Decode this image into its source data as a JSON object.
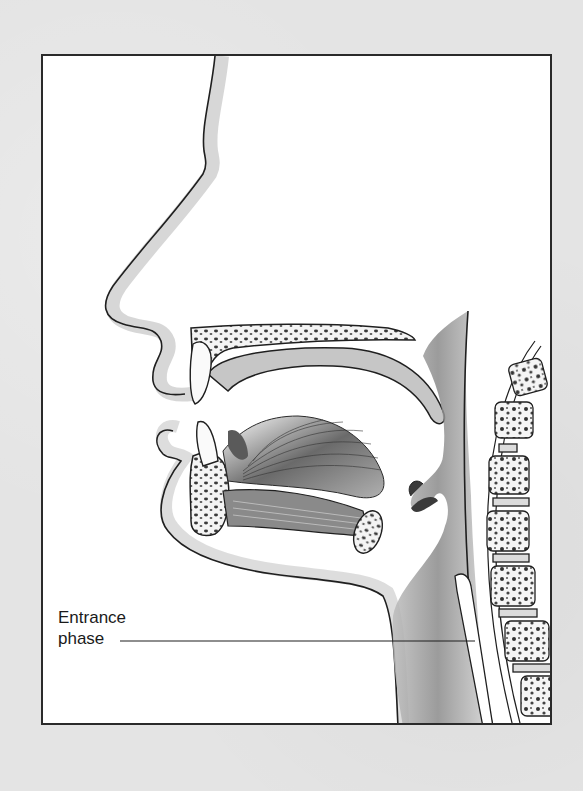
{
  "figure": {
    "colors": {
      "page_background": "#e4e4e4",
      "frame_fill": "#ffffff",
      "frame_border": "#2a2a2a",
      "outline": "#1f1f1f",
      "soft_tissue_shade": "#9a9a9a",
      "bone_fill": "#f4f4f4"
    }
  },
  "annotations": [
    {
      "line1": "Entrance",
      "line2": "phase",
      "pointer_target": "throat (pharynx) entrance"
    }
  ]
}
